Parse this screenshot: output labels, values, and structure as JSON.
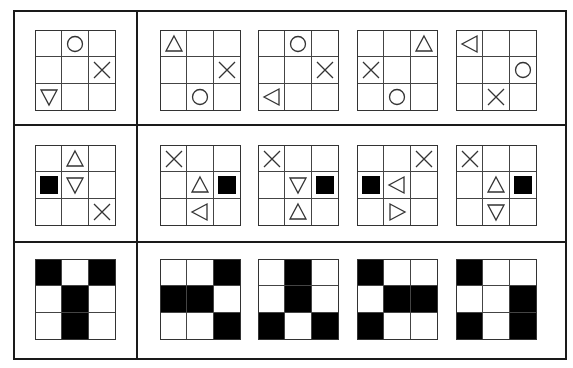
{
  "puzzle": {
    "layout": {
      "frame": {
        "x": 13,
        "y": 10,
        "w": 553,
        "h": 349
      },
      "column_divider_x": 136,
      "row_divider_y": [
        124,
        241
      ],
      "grid_size": 81,
      "question_grid_x": 35,
      "option_grid_x": [
        160,
        258,
        357,
        456
      ],
      "row_grid_y": [
        30,
        145,
        259
      ]
    },
    "rows": [
      {
        "name": "row-1-symbols",
        "question": [
          [
            "",
            "circle",
            ""
          ],
          [
            "",
            "",
            "x"
          ],
          [
            "triangle-down",
            "",
            ""
          ]
        ],
        "options": [
          [
            [
              "triangle-up",
              "",
              ""
            ],
            [
              "",
              "",
              "x"
            ],
            [
              "",
              "circle",
              ""
            ]
          ],
          [
            [
              "",
              "circle",
              ""
            ],
            [
              "",
              "",
              "x"
            ],
            [
              "triangle-left",
              "",
              ""
            ]
          ],
          [
            [
              "",
              "",
              "triangle-up"
            ],
            [
              "x",
              "",
              ""
            ],
            [
              "",
              "circle",
              ""
            ]
          ],
          [
            [
              "triangle-left",
              "",
              ""
            ],
            [
              "",
              "",
              "circle"
            ],
            [
              "",
              "x",
              ""
            ]
          ]
        ]
      },
      {
        "name": "row-2-symbols",
        "question": [
          [
            "",
            "triangle-up",
            ""
          ],
          [
            "square",
            "triangle-down",
            ""
          ],
          [
            "",
            "",
            "x"
          ]
        ],
        "options": [
          [
            [
              "x",
              "",
              ""
            ],
            [
              "",
              "triangle-up",
              "square"
            ],
            [
              "",
              "triangle-left",
              ""
            ]
          ],
          [
            [
              "x",
              "",
              ""
            ],
            [
              "",
              "triangle-down",
              "square"
            ],
            [
              "",
              "triangle-up",
              ""
            ]
          ],
          [
            [
              "",
              "",
              "x"
            ],
            [
              "square",
              "triangle-left",
              ""
            ],
            [
              "",
              "triangle-right",
              ""
            ]
          ],
          [
            [
              "x",
              "",
              ""
            ],
            [
              "",
              "triangle-up",
              "square"
            ],
            [
              "",
              "triangle-down",
              ""
            ]
          ]
        ]
      },
      {
        "name": "row-3-fills",
        "question": [
          [
            "fill",
            "",
            "fill"
          ],
          [
            "",
            "fill",
            ""
          ],
          [
            "",
            "fill",
            ""
          ]
        ],
        "options": [
          [
            [
              "",
              "",
              "fill"
            ],
            [
              "fill",
              "fill",
              ""
            ],
            [
              "",
              "",
              "fill"
            ]
          ],
          [
            [
              "",
              "fill",
              ""
            ],
            [
              "",
              "fill",
              ""
            ],
            [
              "fill",
              "",
              "fill"
            ]
          ],
          [
            [
              "fill",
              "",
              ""
            ],
            [
              "",
              "fill",
              "fill"
            ],
            [
              "fill",
              "",
              ""
            ]
          ],
          [
            [
              "fill",
              "",
              ""
            ],
            [
              "",
              "",
              "fill"
            ],
            [
              "fill",
              "",
              "fill"
            ]
          ]
        ]
      }
    ],
    "colors": {
      "line": "#1a1a1a",
      "fill": "#000000",
      "background": "#ffffff",
      "stroke": "#333333"
    }
  }
}
